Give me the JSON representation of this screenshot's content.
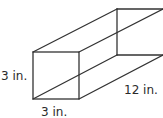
{
  "diagram": {
    "type": "rectangular-prism",
    "labels": {
      "height": "3 in.",
      "width": "3 in.",
      "length": "12 in."
    },
    "stroke_color": "#333333"
  }
}
